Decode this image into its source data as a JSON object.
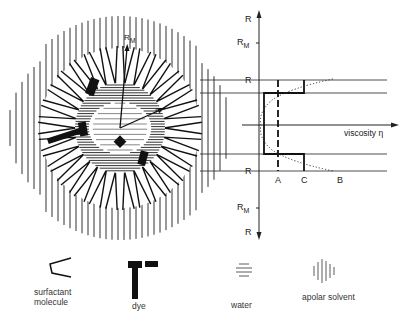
{
  "figure": {
    "type": "schematic micelle diagram with viscosity profile",
    "micelle_labels": {
      "outer_radius": "R",
      "outer_radius_sub": "M",
      "inner_radius": "R"
    },
    "axis": {
      "vertical_labels": [
        {
          "text": "R",
          "sub": ""
        },
        {
          "text": "R",
          "sub": "M"
        },
        {
          "text": "R",
          "sub": ""
        },
        {
          "text": "R",
          "sub": ""
        },
        {
          "text": "R",
          "sub": "M"
        },
        {
          "text": "R",
          "sub": ""
        }
      ],
      "horizontal_label": "viscosity η",
      "curve_labels": [
        "A",
        "C",
        "B"
      ]
    }
  },
  "legend": {
    "items": [
      {
        "icon": "surfactant-molecule-icon",
        "label_line1": "surfactant",
        "label_line2": "molecule"
      },
      {
        "icon": "dye-icon",
        "label_line1": "dye",
        "label_line2": ""
      },
      {
        "icon": "water-icon",
        "label_line1": "water",
        "label_line2": ""
      },
      {
        "icon": "apolar-solvent-icon",
        "label_line1": "apolar solvent",
        "label_line2": ""
      }
    ]
  },
  "colors": {
    "ink": "#1a1a1a",
    "background": "#ffffff"
  }
}
